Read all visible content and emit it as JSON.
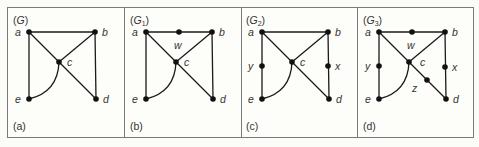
{
  "figure": {
    "panels": [
      {
        "id": "a",
        "title_main": "G",
        "title_sub": "",
        "caption": "(a)",
        "nodes": [
          "a",
          "b",
          "c",
          "d",
          "e"
        ],
        "edges": [
          [
            "a",
            "b"
          ],
          [
            "a",
            "e"
          ],
          [
            "a",
            "d"
          ],
          [
            "b",
            "c"
          ],
          [
            "b",
            "d"
          ],
          [
            "c",
            "e"
          ]
        ]
      },
      {
        "id": "b",
        "title_main": "G",
        "title_sub": "1",
        "caption": "(b)",
        "nodes": [
          "a",
          "b",
          "c",
          "d",
          "e",
          "w"
        ],
        "edges": [
          [
            "a",
            "w"
          ],
          [
            "w",
            "b"
          ],
          [
            "a",
            "e"
          ],
          [
            "a",
            "d"
          ],
          [
            "b",
            "c"
          ],
          [
            "b",
            "d"
          ],
          [
            "c",
            "e"
          ]
        ]
      },
      {
        "id": "c",
        "title_main": "G",
        "title_sub": "2",
        "caption": "(c)",
        "nodes": [
          "a",
          "b",
          "c",
          "d",
          "e",
          "x",
          "y"
        ],
        "edges": [
          [
            "a",
            "b"
          ],
          [
            "a",
            "y"
          ],
          [
            "y",
            "e"
          ],
          [
            "a",
            "d"
          ],
          [
            "b",
            "c"
          ],
          [
            "b",
            "x"
          ],
          [
            "x",
            "d"
          ],
          [
            "c",
            "e"
          ]
        ]
      },
      {
        "id": "d",
        "title_main": "G",
        "title_sub": "3",
        "caption": "(d)",
        "nodes": [
          "a",
          "b",
          "c",
          "d",
          "e",
          "w",
          "x",
          "y",
          "z"
        ],
        "edges": [
          [
            "a",
            "w"
          ],
          [
            "w",
            "b"
          ],
          [
            "a",
            "y"
          ],
          [
            "y",
            "e"
          ],
          [
            "a",
            "c"
          ],
          [
            "c",
            "z"
          ],
          [
            "z",
            "d"
          ],
          [
            "b",
            "c"
          ],
          [
            "b",
            "x"
          ],
          [
            "x",
            "d"
          ],
          [
            "c",
            "e"
          ]
        ]
      }
    ],
    "labels": {
      "a": "a",
      "b": "b",
      "c": "c",
      "d": "d",
      "e": "e",
      "w": "w",
      "x": "x",
      "y": "y",
      "z": "z"
    }
  }
}
